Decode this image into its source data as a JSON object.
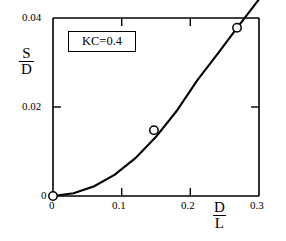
{
  "chart_data": {
    "type": "scatter",
    "title": "",
    "subtitle": "",
    "xlabel_num": "D",
    "xlabel_den": "L",
    "ylabel_num": "S",
    "ylabel_den": "D",
    "xlim": [
      0,
      0.3
    ],
    "ylim": [
      0,
      0.04
    ],
    "xticks": [
      "0",
      "0.1",
      "0.2",
      "0.3"
    ],
    "xtick_values": [
      0,
      0.1,
      0.2,
      0.3
    ],
    "yticks": [
      "0",
      "0.02",
      "0.04"
    ],
    "ytick_values": [
      0,
      0.02,
      0.04
    ],
    "grid": false,
    "legend": "none",
    "annotation": "KC=0.4",
    "marker": "open-circle",
    "series": [
      {
        "name": "measured",
        "style": "open-circle-markers",
        "x": [
          0.0,
          0.147,
          0.268
        ],
        "y": [
          0.0,
          0.0148,
          0.0378
        ]
      },
      {
        "name": "fitted curve",
        "style": "solid-line",
        "x": [
          0.0,
          0.03,
          0.06,
          0.09,
          0.12,
          0.15,
          0.18,
          0.21,
          0.24,
          0.27,
          0.3
        ],
        "y": [
          0.0,
          0.0006,
          0.0022,
          0.0048,
          0.0085,
          0.0133,
          0.0191,
          0.026,
          0.032,
          0.0382,
          0.0442
        ]
      }
    ],
    "colors": {
      "line": "#000000",
      "axis": "#000000",
      "marker_edge": "#000000",
      "marker_fill": "#ffffff",
      "background": "#ffffff"
    }
  },
  "axis_labels": {
    "x_numerator": "D",
    "x_denominator": "L",
    "y_numerator": "S",
    "y_denominator": "D"
  },
  "annotation_box": {
    "text": "KC=0.4"
  },
  "tick_labels": {
    "x": [
      "0",
      "0.1",
      "0.2",
      "0.3"
    ],
    "y_bottom": "0",
    "y_mid": "0.02",
    "y_top": "0.04"
  }
}
